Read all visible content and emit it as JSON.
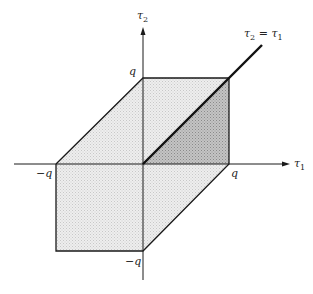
{
  "diagram": {
    "axes": {
      "x_label": "τ",
      "x_sub": "1",
      "y_label": "τ",
      "y_sub": "2"
    },
    "ticks": {
      "x_pos": "q",
      "x_neg": "−q",
      "y_pos": "q",
      "y_neg": "−q"
    },
    "line_label": {
      "lhs": "τ",
      "lhs_sub": "2",
      "eq": " = ",
      "rhs": "τ",
      "rhs_sub": "1"
    },
    "colors": {
      "light_region": "#e4e4e4",
      "dark_region": "#b8b8b8",
      "stroke": "#1a1a1a"
    }
  }
}
